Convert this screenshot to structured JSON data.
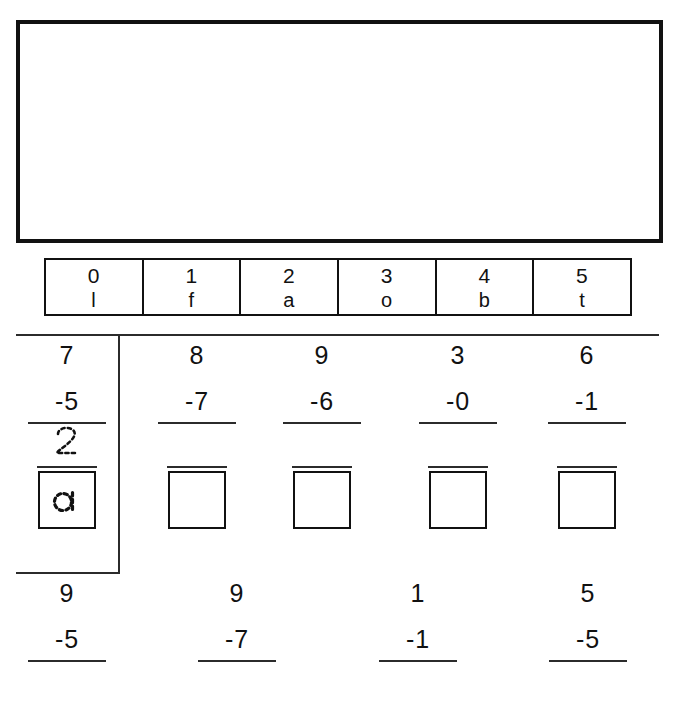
{
  "worksheet": {
    "work_area": {
      "label": "blank work area",
      "content": ""
    },
    "code_key": {
      "label": "number to letter code key",
      "cells": [
        {
          "digit": "0",
          "letter": "l"
        },
        {
          "digit": "1",
          "letter": "f"
        },
        {
          "digit": "2",
          "letter": "a"
        },
        {
          "digit": "3",
          "letter": "o"
        },
        {
          "digit": "4",
          "letter": "b"
        },
        {
          "digit": "5",
          "letter": "t"
        }
      ]
    },
    "row1": {
      "label": "first row of subtraction problems",
      "problems": [
        {
          "minuend": "7",
          "subtrahend": "-5",
          "answer": "2",
          "answer_filled": true,
          "letter": "a",
          "letter_filled": true,
          "is_example": true
        },
        {
          "minuend": "8",
          "subtrahend": "-7",
          "answer": "",
          "answer_filled": false,
          "letter": "",
          "letter_filled": false,
          "is_example": false
        },
        {
          "minuend": "9",
          "subtrahend": "-6",
          "answer": "",
          "answer_filled": false,
          "letter": "",
          "letter_filled": false,
          "is_example": false
        },
        {
          "minuend": "3",
          "subtrahend": "-0",
          "answer": "",
          "answer_filled": false,
          "letter": "",
          "letter_filled": false,
          "is_example": false
        },
        {
          "minuend": "6",
          "subtrahend": "-1",
          "answer": "",
          "answer_filled": false,
          "letter": "",
          "letter_filled": false,
          "is_example": false
        }
      ]
    },
    "row2": {
      "label": "second row of subtraction problems",
      "problems": [
        {
          "minuend": "9",
          "subtrahend": "-5",
          "answer": ""
        },
        {
          "minuend": "9",
          "subtrahend": "-7",
          "answer": ""
        },
        {
          "minuend": "1",
          "subtrahend": "-1",
          "answer": ""
        },
        {
          "minuend": "5",
          "subtrahend": "-5",
          "answer": ""
        }
      ]
    },
    "colors": {
      "ink": "#111111",
      "rule": "#2b2b2b",
      "paper": "#ffffff"
    }
  }
}
